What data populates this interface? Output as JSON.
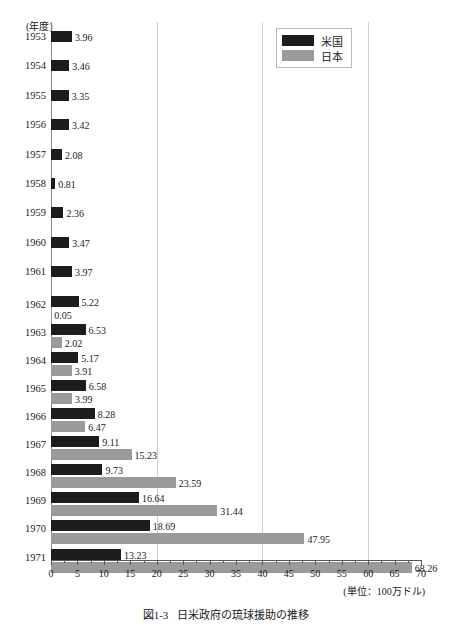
{
  "chart_data": {
    "type": "bar",
    "orientation": "horizontal",
    "caption_number": "図1-3",
    "caption_text": "日米政府の琉球援助の推移",
    "xlabel": "",
    "ylabel": "(年度)",
    "unit_note": "(単位：100万ドル)",
    "xlim": [
      0,
      70
    ],
    "xticks": [
      0,
      5,
      10,
      15,
      20,
      25,
      30,
      35,
      40,
      45,
      50,
      55,
      60,
      65,
      70
    ],
    "xtick_labels": [
      "0",
      "5",
      "10",
      "15",
      "20",
      "25",
      "30",
      "35",
      "40",
      "45",
      "50",
      "55",
      "60",
      "65",
      "70"
    ],
    "gridlines": [
      20,
      40,
      60
    ],
    "grid": true,
    "legend_position": "top-right",
    "categories": [
      "1953",
      "1954",
      "1955",
      "1956",
      "1957",
      "1958",
      "1959",
      "1960",
      "1961",
      "1962",
      "1963",
      "1964",
      "1965",
      "1966",
      "1967",
      "1968",
      "1969",
      "1970",
      "1971"
    ],
    "series": [
      {
        "name": "米国",
        "color": "#1c1c1c",
        "values": [
          3.96,
          3.46,
          3.35,
          3.42,
          2.08,
          0.81,
          2.36,
          3.47,
          3.97,
          5.22,
          6.53,
          5.17,
          6.58,
          8.28,
          9.11,
          9.73,
          16.64,
          18.69,
          13.23
        ]
      },
      {
        "name": "日本",
        "color": "#9a9a9a",
        "values": [
          null,
          null,
          null,
          null,
          null,
          null,
          null,
          null,
          null,
          0.05,
          2.02,
          3.91,
          3.99,
          6.47,
          15.23,
          23.59,
          31.44,
          47.95,
          68.26
        ]
      }
    ]
  },
  "legend": {
    "items": [
      {
        "label": "米国",
        "color": "#1c1c1c"
      },
      {
        "label": "日本",
        "color": "#9a9a9a"
      }
    ]
  },
  "axes": {
    "y_title": "(年度)",
    "unit": "(単位：100万ドル)"
  },
  "caption": {
    "number": "図1-3",
    "text": "日米政府の琉球援助の推移"
  }
}
